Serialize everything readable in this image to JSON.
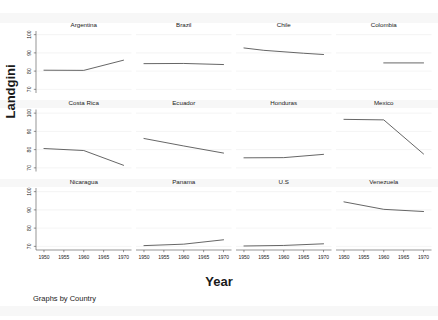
{
  "chart_data": {
    "type": "line",
    "title": "",
    "xlabel": "Year",
    "ylabel": "Landgini",
    "footnote": "Graphs by Country",
    "layout": "small-multiples 3 rows x 4 columns",
    "grid": true,
    "legend": "none",
    "xlim": [
      1948,
      1972
    ],
    "ylim": [
      68,
      102
    ],
    "xticks": [
      1950,
      1955,
      1960,
      1965,
      1970
    ],
    "xtick_labels": [
      "1950",
      "1955",
      "1960",
      "1965",
      "1970"
    ],
    "yticks": [
      70,
      80,
      90,
      100
    ],
    "ytick_labels": [
      "70",
      "80",
      "90",
      "100"
    ],
    "panels": [
      {
        "name": "Argentina",
        "row": 0,
        "col": 0,
        "x": [
          1950,
          1960,
          1970
        ],
        "values": [
          80.5,
          80.4,
          86.0
        ]
      },
      {
        "name": "Brazil",
        "row": 0,
        "col": 1,
        "x": [
          1950,
          1960,
          1970
        ],
        "values": [
          84.1,
          84.2,
          83.6
        ]
      },
      {
        "name": "Chile",
        "row": 0,
        "col": 2,
        "x": [
          1950,
          1955,
          1965,
          1970
        ],
        "values": [
          92.7,
          91.4,
          89.8,
          89.1
        ]
      },
      {
        "name": "Colombia",
        "row": 0,
        "col": 3,
        "x": [
          1960,
          1970
        ],
        "values": [
          84.5,
          84.5
        ]
      },
      {
        "name": "Costa Rica",
        "row": 1,
        "col": 0,
        "x": [
          1950,
          1960,
          1970
        ],
        "values": [
          80.6,
          79.5,
          71.4
        ]
      },
      {
        "name": "Ecuador",
        "row": 1,
        "col": 1,
        "x": [
          1950,
          1960,
          1970
        ],
        "values": [
          86.1,
          82.0,
          78.1
        ]
      },
      {
        "name": "Honduras",
        "row": 1,
        "col": 2,
        "x": [
          1950,
          1960,
          1970
        ],
        "values": [
          75.5,
          75.6,
          77.4
        ]
      },
      {
        "name": "Mexico",
        "row": 1,
        "col": 3,
        "x": [
          1950,
          1960,
          1970
        ],
        "values": [
          96.6,
          96.3,
          77.6
        ]
      },
      {
        "name": "Nicaragua",
        "row": 2,
        "col": 0,
        "x": [],
        "values": []
      },
      {
        "name": "Panama",
        "row": 2,
        "col": 1,
        "x": [
          1950,
          1960,
          1970
        ],
        "values": [
          70.4,
          71.2,
          73.6
        ]
      },
      {
        "name": "U.S",
        "row": 2,
        "col": 2,
        "x": [
          1950,
          1960,
          1970
        ],
        "values": [
          70.2,
          70.5,
          71.4
        ]
      },
      {
        "name": "Venezuela",
        "row": 2,
        "col": 3,
        "x": [
          1950,
          1960,
          1970
        ],
        "values": [
          94.4,
          90.3,
          89.1
        ]
      }
    ]
  }
}
